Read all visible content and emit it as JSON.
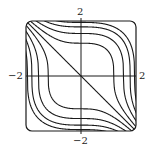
{
  "chart_data": {
    "type": "contour",
    "title": "",
    "function": "x^3 + y^3",
    "xlim": [
      -2,
      2
    ],
    "ylim": [
      -2,
      2
    ],
    "levels": [
      -7.4,
      -5.7,
      -3.7,
      -1.7,
      0,
      1.7,
      3.7,
      5.7,
      7.4
    ],
    "tick_labels": {
      "x_left": "−2",
      "x_right": "2",
      "y_top": "2",
      "y_bottom": "−2"
    },
    "axes": "cross through origin",
    "frame": "rounded square",
    "grid": false,
    "legend": null
  },
  "colors": {
    "line": "#1a1a1a",
    "background": "#ffffff"
  }
}
